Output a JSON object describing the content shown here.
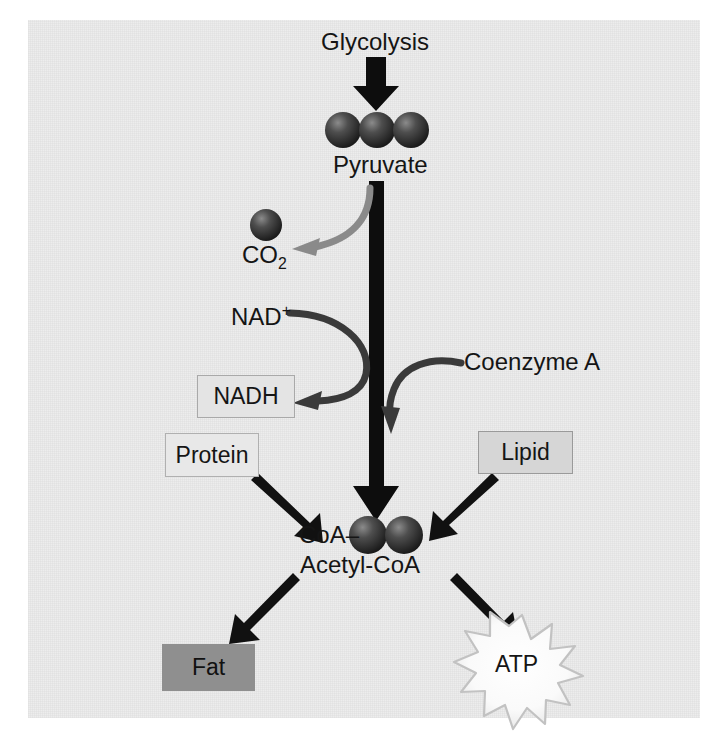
{
  "diagram": {
    "background_color": "#ececec",
    "page_color": "#ffffff"
  },
  "labels": {
    "glycolysis": "Glycolysis",
    "pyruvate": "Pyruvate",
    "co2_base": "CO",
    "co2_sub": "2",
    "nad_base": "NAD",
    "nad_sup": "+",
    "coenzyme_a": "Coenzyme A",
    "coa_prefix": "CoA–",
    "acetyl_coa": "Acetyl-CoA",
    "atp": "ATP"
  },
  "boxes": {
    "nadh": {
      "label": "NADH",
      "fill": "#e4e4e4",
      "border": "#a9a9a9"
    },
    "protein": {
      "label": "Protein",
      "fill": "#e8e8e8",
      "border": "#b0b0b0"
    },
    "lipid": {
      "label": "Lipid",
      "fill": "#d6d6d6",
      "border": "#9a9a9a"
    },
    "fat": {
      "label": "Fat",
      "fill": "#8f8f8f",
      "border": "none"
    }
  },
  "molecules": {
    "pyruvate_spheres": 3,
    "acetyl_spheres": 2,
    "co2_spheres": 1,
    "sphere_color": "#3a3a3a"
  },
  "arrows": {
    "glycolysis_to_pyruvate": {
      "color": "#0d0d0d",
      "style": "thick-straight-down"
    },
    "pyruvate_to_acetyl": {
      "color": "#0d0d0d",
      "style": "thick-straight-down"
    },
    "release_co2": {
      "color": "#8a8a8a",
      "style": "curved-left"
    },
    "nad_to_nadh": {
      "color": "#3a3a3a",
      "style": "curved-left"
    },
    "coenzyme_a_in": {
      "color": "#3a3a3a",
      "style": "curved-down-left"
    },
    "protein_to_acetyl": {
      "color": "#111111",
      "style": "diagonal"
    },
    "lipid_to_acetyl": {
      "color": "#111111",
      "style": "diagonal"
    },
    "acetyl_to_fat": {
      "color": "#111111",
      "style": "diagonal"
    },
    "acetyl_to_atp": {
      "color": "#111111",
      "style": "diagonal"
    }
  },
  "atp_burst": {
    "fill": "#fdfdfd",
    "stroke": "#c2c2c2",
    "points": 14
  }
}
